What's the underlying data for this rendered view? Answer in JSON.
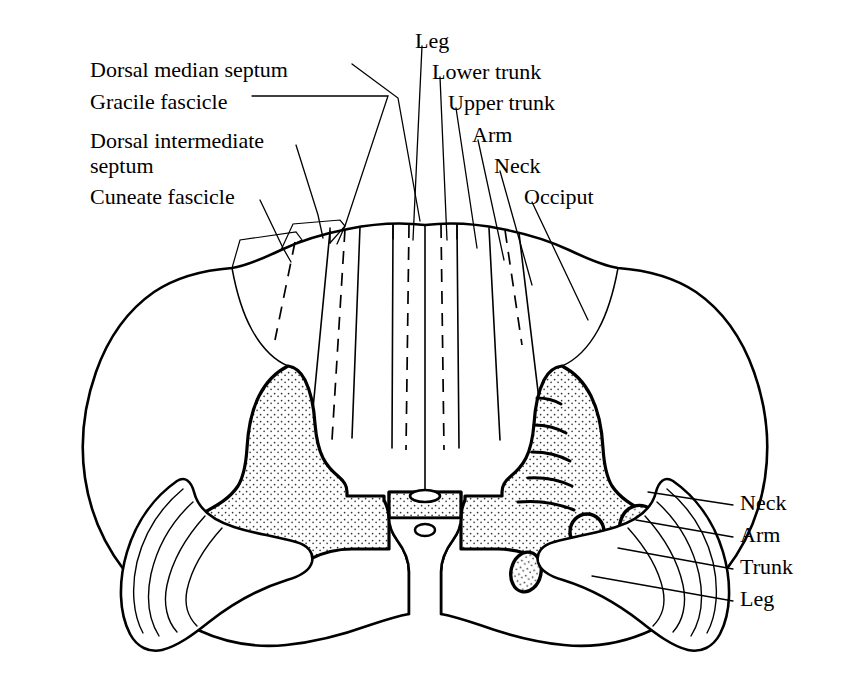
{
  "figure": {
    "background_color": "#ffffff",
    "ink_color": "#000000"
  },
  "labels_left": [
    {
      "id": "dorsal-median-septum",
      "text": "Dorsal median septum",
      "x": 90,
      "y": 57
    },
    {
      "id": "gracile-fascicle",
      "text": "Gracile fascicle",
      "x": 90,
      "y": 89
    },
    {
      "id": "dorsal-intermediate-septum-line1",
      "text": "Dorsal intermediate",
      "x": 90,
      "y": 128
    },
    {
      "id": "dorsal-intermediate-septum-line2",
      "text": "septum",
      "x": 90,
      "y": 153
    },
    {
      "id": "cuneate-fascicle",
      "text": "Cuneate fascicle",
      "x": 90,
      "y": 184
    }
  ],
  "labels_top_right": [
    {
      "id": "leg-dorsal",
      "text": "Leg",
      "x": 415,
      "y": 28
    },
    {
      "id": "lower-trunk",
      "text": "Lower trunk",
      "x": 432,
      "y": 59
    },
    {
      "id": "upper-trunk",
      "text": "Upper trunk",
      "x": 448,
      "y": 90
    },
    {
      "id": "arm-dorsal",
      "text": "Arm",
      "x": 472,
      "y": 122
    },
    {
      "id": "neck-dorsal",
      "text": "Neck",
      "x": 494,
      "y": 153
    },
    {
      "id": "occiput",
      "text": "Occiput",
      "x": 524,
      "y": 184
    }
  ],
  "labels_right": [
    {
      "id": "neck-lateral",
      "text": "Neck",
      "x": 740,
      "y": 502
    },
    {
      "id": "arm-lateral",
      "text": "Arm",
      "x": 740,
      "y": 534
    },
    {
      "id": "trunk-lateral",
      "text": "Trunk",
      "x": 740,
      "y": 566
    },
    {
      "id": "leg-lateral",
      "text": "Leg",
      "x": 740,
      "y": 598
    }
  ],
  "structures": {
    "cord_outline": "spinal-cord-outline",
    "gray_matter_left": "gray-matter-left-butterfly",
    "gray_matter_right": "gray-matter-right-butterfly",
    "dorsal_columns": "dorsal-column-fan",
    "lateral_corticospinal_tract_left": "lateral-corticospinal-tract-left",
    "lateral_corticospinal_tract_right": "lateral-corticospinal-tract-right",
    "central_canal": "central-canal",
    "ventral_median_fissure": "ventral-median-fissure",
    "dorsal_horn_bands": 5,
    "motor_nuclei_count": 4
  }
}
